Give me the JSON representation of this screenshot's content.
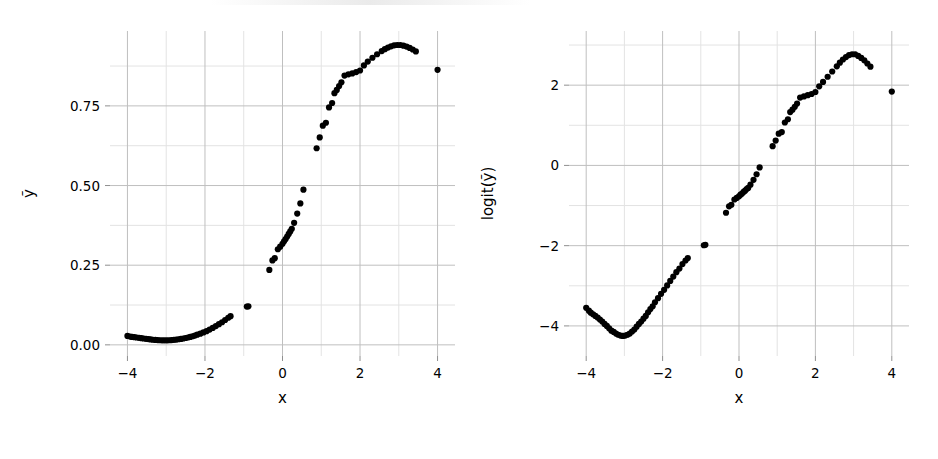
{
  "figure": {
    "background": "#ffffff",
    "point_color": "#000000",
    "grid_major_color": "#bfbfbf",
    "grid_minor_color": "#e3e3e3"
  },
  "chart_data": [
    {
      "type": "scatter",
      "panel": "left",
      "title": "",
      "xlabel": "x",
      "ylabel": "ỹ",
      "xlim": [
        -4.45,
        4.45
      ],
      "ylim": [
        -0.035,
        0.985
      ],
      "xticks": [
        -4,
        -2,
        0,
        2,
        4
      ],
      "xticklabels": [
        "−4",
        "−2",
        "0",
        "2",
        "4"
      ],
      "yticks": [
        0.0,
        0.25,
        0.5,
        0.75
      ],
      "yticklabels": [
        "0.00",
        "0.25",
        "0.50",
        "0.75"
      ],
      "xminor": [
        -3,
        -1,
        1,
        3
      ],
      "yminor": [
        0.125,
        0.375,
        0.625,
        0.875
      ],
      "grid": true,
      "legend": "none",
      "point_size": 3.1,
      "x": [
        -4.0,
        -3.93,
        -3.88,
        -3.82,
        -3.76,
        -3.7,
        -3.64,
        -3.58,
        -3.52,
        -3.46,
        -3.4,
        -3.34,
        -3.28,
        -3.22,
        -3.16,
        -3.1,
        -3.04,
        -2.98,
        -2.92,
        -2.86,
        -2.8,
        -2.74,
        -2.68,
        -2.62,
        -2.56,
        -2.5,
        -2.44,
        -2.38,
        -2.32,
        -2.26,
        -2.2,
        -2.12,
        -2.04,
        -1.96,
        -1.88,
        -1.8,
        -1.72,
        -1.64,
        -1.56,
        -1.48,
        -1.4,
        -1.34,
        -0.92,
        -0.88,
        -0.34,
        -0.26,
        -0.2,
        -0.12,
        -0.06,
        0.0,
        0.04,
        0.08,
        0.12,
        0.16,
        0.2,
        0.24,
        0.3,
        0.38,
        0.46,
        0.54,
        0.88,
        0.96,
        1.04,
        1.12,
        1.2,
        1.28,
        1.34,
        1.4,
        1.46,
        1.52,
        1.6,
        1.7,
        1.8,
        1.9,
        2.0,
        2.1,
        2.2,
        2.32,
        2.44,
        2.56,
        2.64,
        2.72,
        2.8,
        2.88,
        2.96,
        3.04,
        3.12,
        3.2,
        3.28,
        3.36,
        3.44,
        4.0
      ],
      "y": [
        0.028,
        0.026,
        0.025,
        0.024,
        0.023,
        0.022,
        0.021,
        0.02,
        0.019,
        0.018,
        0.017,
        0.016,
        0.0155,
        0.015,
        0.0145,
        0.0142,
        0.0141,
        0.0142,
        0.0145,
        0.015,
        0.0157,
        0.0165,
        0.0175,
        0.0187,
        0.02,
        0.0215,
        0.023,
        0.025,
        0.027,
        0.029,
        0.032,
        0.035,
        0.039,
        0.043,
        0.048,
        0.053,
        0.059,
        0.065,
        0.071,
        0.078,
        0.085,
        0.09,
        0.12,
        0.121,
        0.235,
        0.265,
        0.272,
        0.3,
        0.308,
        0.317,
        0.325,
        0.332,
        0.34,
        0.348,
        0.356,
        0.364,
        0.383,
        0.412,
        0.444,
        0.487,
        0.617,
        0.651,
        0.688,
        0.697,
        0.745,
        0.759,
        0.79,
        0.8,
        0.812,
        0.824,
        0.845,
        0.849,
        0.852,
        0.856,
        0.861,
        0.877,
        0.889,
        0.901,
        0.912,
        0.922,
        0.928,
        0.933,
        0.937,
        0.94,
        0.941,
        0.941,
        0.939,
        0.936,
        0.932,
        0.927,
        0.921,
        0.863
      ]
    },
    {
      "type": "scatter",
      "panel": "right",
      "title": "",
      "xlabel": "x",
      "ylabel": "logit(ỹ)",
      "xlim": [
        -4.45,
        4.45
      ],
      "ylim": [
        -4.75,
        3.35
      ],
      "xticks": [
        -4,
        -2,
        0,
        2,
        4
      ],
      "xticklabels": [
        "−4",
        "−2",
        "0",
        "2",
        "4"
      ],
      "yticks": [
        -4,
        -2,
        0,
        2
      ],
      "yticklabels": [
        "−4",
        "−2",
        "0",
        "2"
      ],
      "xminor": [
        -3,
        -1,
        1,
        3
      ],
      "yminor": [
        -3,
        -1,
        1,
        3
      ],
      "grid": true,
      "legend": "none",
      "point_size": 3.1,
      "x": [
        -4.0,
        -3.93,
        -3.88,
        -3.82,
        -3.76,
        -3.7,
        -3.64,
        -3.58,
        -3.52,
        -3.46,
        -3.4,
        -3.34,
        -3.28,
        -3.22,
        -3.16,
        -3.1,
        -3.04,
        -2.98,
        -2.92,
        -2.86,
        -2.8,
        -2.74,
        -2.68,
        -2.62,
        -2.56,
        -2.5,
        -2.44,
        -2.38,
        -2.32,
        -2.26,
        -2.2,
        -2.12,
        -2.04,
        -1.96,
        -1.88,
        -1.8,
        -1.72,
        -1.64,
        -1.56,
        -1.48,
        -1.4,
        -1.34,
        -0.92,
        -0.88,
        -0.34,
        -0.26,
        -0.2,
        -0.12,
        -0.06,
        0.0,
        0.04,
        0.08,
        0.12,
        0.16,
        0.2,
        0.24,
        0.3,
        0.38,
        0.46,
        0.54,
        0.88,
        0.96,
        1.04,
        1.12,
        1.2,
        1.28,
        1.34,
        1.4,
        1.46,
        1.52,
        1.6,
        1.7,
        1.8,
        1.9,
        2.0,
        2.1,
        2.2,
        2.32,
        2.44,
        2.56,
        2.64,
        2.72,
        2.8,
        2.88,
        2.96,
        3.04,
        3.12,
        3.2,
        3.28,
        3.36,
        3.44,
        4.0
      ],
      "y": [
        -3.55,
        -3.62,
        -3.67,
        -3.71,
        -3.75,
        -3.79,
        -3.84,
        -3.89,
        -3.95,
        -4.0,
        -4.06,
        -4.12,
        -4.15,
        -4.19,
        -4.22,
        -4.24,
        -4.25,
        -4.24,
        -4.22,
        -4.19,
        -4.14,
        -4.09,
        -4.02,
        -3.95,
        -3.89,
        -3.82,
        -3.75,
        -3.66,
        -3.58,
        -3.51,
        -3.41,
        -3.31,
        -3.2,
        -3.1,
        -2.99,
        -2.88,
        -2.77,
        -2.66,
        -2.57,
        -2.46,
        -2.37,
        -2.31,
        -1.99,
        -1.98,
        -1.18,
        -1.02,
        -0.98,
        -0.85,
        -0.81,
        -0.77,
        -0.73,
        -0.7,
        -0.66,
        -0.63,
        -0.59,
        -0.56,
        -0.48,
        -0.36,
        -0.22,
        -0.05,
        0.48,
        0.62,
        0.79,
        0.83,
        1.07,
        1.15,
        1.33,
        1.39,
        1.46,
        1.54,
        1.69,
        1.72,
        1.75,
        1.78,
        1.83,
        1.97,
        2.08,
        2.21,
        2.34,
        2.47,
        2.56,
        2.64,
        2.7,
        2.75,
        2.77,
        2.77,
        2.73,
        2.68,
        2.62,
        2.54,
        2.46,
        1.84
      ]
    }
  ]
}
